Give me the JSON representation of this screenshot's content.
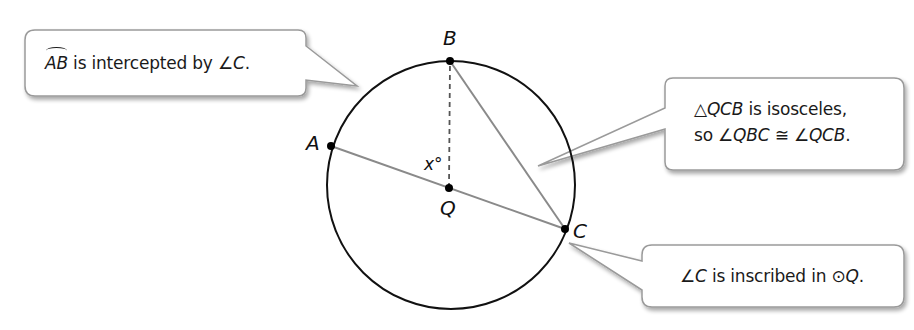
{
  "diagram": {
    "points": {
      "A": {
        "label": "A"
      },
      "B": {
        "label": "B"
      },
      "C": {
        "label": "C"
      },
      "Q": {
        "label": "Q"
      }
    },
    "angle_label": "x°",
    "colors": {
      "circle": "#111111",
      "chord": "#8a8a8a",
      "callout_border": "#9a9a9a",
      "callout_fill": "#ffffff",
      "text": "#1a1a1a"
    }
  },
  "callouts": {
    "arc": {
      "arc_name": "AB",
      "text": " is intercepted by ",
      "angle": "∠C",
      "end": "."
    },
    "isosceles": {
      "line1_sym": "△",
      "line1_tri": "QCB",
      "line1_rest": " is isosceles,",
      "line2_pre": "so ",
      "line2_a1": "∠QBC",
      "line2_cong": " ≅ ",
      "line2_a2": "∠QCB",
      "line2_end": "."
    },
    "inscribed": {
      "angle": "∠C",
      "text": " is inscribed in ",
      "circle_sym": "⊙",
      "circle_name": "Q",
      "end": "."
    }
  }
}
